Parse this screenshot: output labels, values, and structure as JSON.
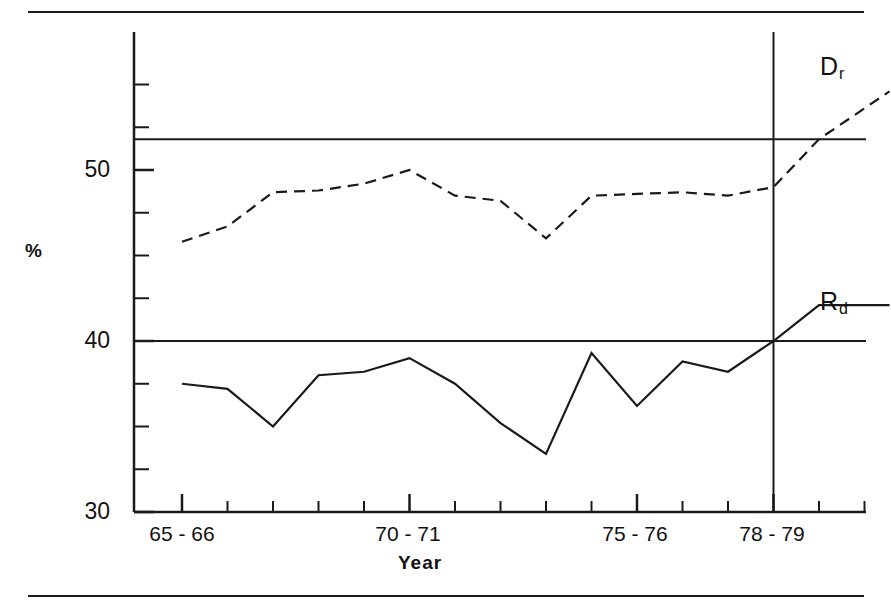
{
  "figure": {
    "background_color": "#ffffff",
    "ink_color": "#1a1a1a",
    "top_rule": "",
    "bottom_rule": ""
  },
  "axes": {
    "ylabel": "%",
    "xlabel": "Year",
    "y_tick_labels": [
      "50",
      "40",
      "30"
    ],
    "y_tick_values": [
      50,
      40,
      30
    ],
    "x_tick_labels": [
      "65 - 66",
      "70 - 71",
      "75 - 76",
      "78 - 79"
    ],
    "x_tick_label_years": [
      "65-66",
      "70-71",
      "75-76",
      "78-79"
    ]
  },
  "series_labels": {
    "dashed": {
      "base": "D",
      "sub": "r",
      "full": "Dr"
    },
    "solid": {
      "base": "R",
      "sub": "d",
      "full": "Rd"
    }
  },
  "chart_data": {
    "type": "line",
    "title": "",
    "subtitle": "",
    "xlabel": "Year",
    "ylabel": "%",
    "xlim": [
      0,
      15
    ],
    "ylim": [
      30,
      56.5
    ],
    "grid": false,
    "legend": "inline-end-of-line",
    "x": [
      "65-66",
      "66-67",
      "67-68",
      "68-69",
      "69-70",
      "70-71",
      "71-72",
      "72-73",
      "73-74",
      "74-75",
      "75-76",
      "76-77",
      "77-78",
      "78-79",
      "79-80"
    ],
    "x_tick_positions": [
      0,
      5,
      10,
      13
    ],
    "x_major_tick_labels": [
      "65 - 66",
      "70 - 71",
      "75 - 76",
      "78 - 79"
    ],
    "y_major_ticks": [
      50,
      40,
      30
    ],
    "y_minor_tick_step": 2.5,
    "series": [
      {
        "name": "Dr",
        "style": "dashed",
        "values": [
          45.8,
          46.7,
          48.7,
          48.8,
          49.2,
          50.0,
          48.5,
          48.2,
          46.0,
          48.5,
          48.6,
          48.7,
          48.5,
          49.0,
          51.8
        ]
      },
      {
        "name": "Rd",
        "style": "solid",
        "values": [
          37.5,
          37.2,
          35.0,
          38.0,
          38.2,
          39.0,
          37.5,
          35.2,
          33.4,
          39.3,
          36.2,
          38.8,
          38.2,
          40.0,
          42.1
        ]
      }
    ],
    "series_extensions": [
      {
        "name": "Dr",
        "from_x": "78-79",
        "from_y": 51.8,
        "to_y": 54.6,
        "note": "dashed tail rising past marker year"
      },
      {
        "name": "Rd",
        "from_x": "78-79",
        "from_y": 40.0,
        "to_y": 42.1,
        "note": "solid tail rising past marker year"
      }
    ],
    "reference_lines": [
      {
        "orientation": "horizontal",
        "value": 51.8,
        "label": ""
      },
      {
        "orientation": "horizontal",
        "value": 40.0,
        "label": ""
      },
      {
        "orientation": "vertical",
        "value": "78-79",
        "label": ""
      }
    ],
    "annotations": [
      {
        "text": "Dr",
        "series": "Dr",
        "position": "right-of-line-end"
      },
      {
        "text": "Rd",
        "series": "Rd",
        "position": "right-of-line-end"
      }
    ]
  }
}
